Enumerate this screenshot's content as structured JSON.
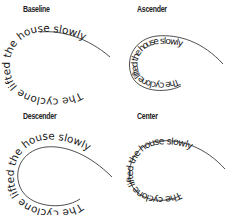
{
  "diagram": {
    "phrase": "The cyclone lifted the house slowly",
    "colors": {
      "text": "#1a1a1a",
      "path": "#222222",
      "background": "#ffffff"
    },
    "panels": [
      {
        "id": "baseline",
        "title": "Baseline",
        "text": "The cyclone lifted the house slowly"
      },
      {
        "id": "ascender",
        "title": "Ascender",
        "text": "The cyclone lifted the house slowly"
      },
      {
        "id": "descender",
        "title": "Descender",
        "text": "The cyclone lifted the house slowly"
      },
      {
        "id": "center",
        "title": "Center",
        "text": "The cyclone lifted the house slowly"
      }
    ]
  }
}
